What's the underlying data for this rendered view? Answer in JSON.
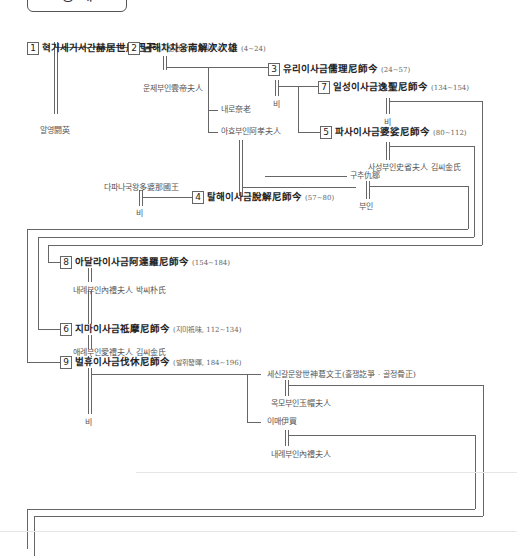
{
  "title": "왕 계",
  "kings": [
    {
      "num": "1",
      "name": "혁거세거서간赫居世居西干",
      "years": "(기원전 57~기원후 4)"
    },
    {
      "num": "2",
      "name": "남해차차웅南解次次雄",
      "years": "(4~24)"
    },
    {
      "num": "3",
      "name": "유리이사금儒理尼師今",
      "years": "(24~57)"
    },
    {
      "num": "7",
      "name": "일성이사금逸聖尼師今",
      "years": "(134~154)"
    },
    {
      "num": "5",
      "name": "파사이사금婆娑尼師今",
      "years": "(80~112)"
    },
    {
      "num": "4",
      "name": "탈해이사금脫解尼師今",
      "years": "(57~80)"
    },
    {
      "num": "8",
      "name": "아달라이사금阿達羅尼師今",
      "years": "(154~184)"
    },
    {
      "num": "6",
      "name": "지마이사금祗摩尼師今",
      "years": "(지미祗味, 112~134)"
    },
    {
      "num": "9",
      "name": "벌휴이사금伐休尼師今",
      "years": "(발휘發暉, 184~196)"
    }
  ],
  "persons": {
    "aryeong": "알영閼英",
    "unje": "운제부인雲帝夫人",
    "bi3": "비",
    "bi7": "비",
    "naero": "내로奈老",
    "ahyo": "아효부인阿孝夫人",
    "saseong": "사성부인史省夫人 김씨金氏",
    "dapana": "다파나국왕多婆那國王",
    "bi_dapana": "비",
    "guchu": "구추仇鄒",
    "buin": "부인",
    "naerye8": "내례부인內禮夫人 박씨朴氏",
    "aerye": "애례부인愛禮夫人 김씨金氏",
    "bi9": "비",
    "sesin": "세신갈문왕世神葛文王(흘쟁訖爭 · 골정骨正)",
    "okmo": "옥모부인玉帽夫人",
    "imae": "이매伊買",
    "naerye": "내례부인內禮夫人"
  }
}
